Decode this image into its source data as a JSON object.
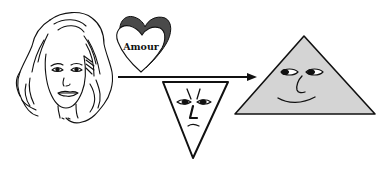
{
  "diagram": {
    "heart_label": "Amour",
    "figures": [
      {
        "id": "woman",
        "description": "line drawing of a woman's face with long wavy hair"
      },
      {
        "id": "heart",
        "description": "3D shaded heart labelled Amour"
      },
      {
        "id": "inverted-triangle-face",
        "description": "downward-pointing triangle with frowning face"
      },
      {
        "id": "triangle-face",
        "description": "grey upward-pointing triangle with smiling face"
      }
    ],
    "arrow": {
      "direction": "right"
    },
    "colors": {
      "line": "#111111",
      "triangle_fill": "#d4d4d4",
      "heart_shadow": "#555555"
    }
  }
}
